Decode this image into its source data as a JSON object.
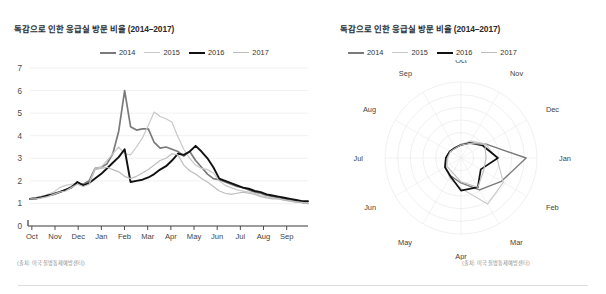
{
  "colors": {
    "series_2014": "#7a7a7a",
    "series_2015": "#c8c8c8",
    "series_2016": "#111111",
    "series_2017": "#bdbdbd",
    "grid": "#e9e9e9",
    "axis": "#3a3a3a",
    "text": "#3c3c3c",
    "note": "#8a8a8a",
    "divider": "#dddddd",
    "background": "#ffffff"
  },
  "left_panel": {
    "title": "독감으로 인한 응급실 방문 비율 (2014–2017)",
    "source_note": "(출처: 미국 질병통제예방센터)",
    "legend": [
      {
        "label": "2014",
        "color": "#7a7a7a",
        "width": 2.4
      },
      {
        "label": "2015",
        "color": "#c8c8c8",
        "width": 1.6
      },
      {
        "label": "2016",
        "color": "#111111",
        "width": 2.6
      },
      {
        "label": "2017",
        "color": "#bdbdbd",
        "width": 1.6
      }
    ]
  },
  "right_panel": {
    "title": "독감으로 인한 응급실 방문 비율 (2014–2017)",
    "source_note": "(출처: 미국 질병통제예방센터)",
    "legend": [
      {
        "label": "2014",
        "color": "#7a7a7a",
        "width": 2.4
      },
      {
        "label": "2015",
        "color": "#c8c8c8",
        "width": 1.6
      },
      {
        "label": "2016",
        "color": "#111111",
        "width": 2.6
      },
      {
        "label": "2017",
        "color": "#bdbdbd",
        "width": 1.6
      }
    ]
  },
  "chart_data": [
    {
      "type": "line",
      "title": "독감으로 인한 응급실 방문 비율 (2014–2017)",
      "xlabel": "",
      "ylabel": "",
      "ylim": [
        0,
        7
      ],
      "yticks": [
        0,
        1,
        2,
        3,
        4,
        5,
        6,
        7
      ],
      "grid": true,
      "legend_position": "top-center",
      "categories": [
        "Oct",
        "Nov",
        "Dec",
        "Jan",
        "Feb",
        "Mar",
        "Apr",
        "May",
        "Jun",
        "Jul",
        "Aug",
        "Sep"
      ],
      "x_tick_labels": [
        "Oct",
        "Nov",
        "Dec",
        "Jan",
        "Feb",
        "Mar",
        "Apr",
        "May",
        "Jun",
        "Jul",
        "Aug",
        "Sep"
      ],
      "n_points_per_series": 48,
      "series": [
        {
          "name": "2014",
          "color": "#7a7a7a",
          "values": [
            1.2,
            1.25,
            1.3,
            1.35,
            1.45,
            1.5,
            1.6,
            1.75,
            1.9,
            1.85,
            2.0,
            2.55,
            2.6,
            2.75,
            3.2,
            4.2,
            6.0,
            4.4,
            4.25,
            4.3,
            4.3,
            3.7,
            3.45,
            3.5,
            3.4,
            3.3,
            3.1,
            3.3,
            2.9,
            2.6,
            2.3,
            2.1,
            2.05,
            1.95,
            1.85,
            1.75,
            1.7,
            1.6,
            1.5,
            1.45,
            1.35,
            1.3,
            1.25,
            1.2,
            1.15,
            1.1,
            1.05,
            1.0
          ]
        },
        {
          "name": "2015",
          "color": "#c8c8c8",
          "values": [
            1.2,
            1.25,
            1.3,
            1.4,
            1.5,
            1.7,
            1.8,
            1.85,
            1.9,
            1.8,
            1.9,
            2.55,
            2.6,
            2.9,
            3.2,
            3.5,
            3.2,
            3.15,
            3.5,
            3.9,
            4.45,
            5.05,
            4.85,
            4.75,
            4.6,
            3.95,
            3.4,
            3.0,
            2.7,
            2.55,
            2.5,
            2.35,
            2.0,
            1.8,
            1.7,
            1.6,
            1.55,
            1.5,
            1.45,
            1.35,
            1.3,
            1.25,
            1.2,
            1.15,
            1.1,
            1.1,
            1.05,
            1.0
          ]
        },
        {
          "name": "2016",
          "color": "#111111",
          "values": [
            1.2,
            1.22,
            1.28,
            1.35,
            1.4,
            1.5,
            1.6,
            1.7,
            1.95,
            1.8,
            1.9,
            2.1,
            2.3,
            2.55,
            2.8,
            3.05,
            3.4,
            1.95,
            2.0,
            2.05,
            2.15,
            2.3,
            2.5,
            2.65,
            2.9,
            3.2,
            3.15,
            3.3,
            3.55,
            3.3,
            3.0,
            2.6,
            2.1,
            2.0,
            1.9,
            1.8,
            1.7,
            1.65,
            1.55,
            1.5,
            1.4,
            1.35,
            1.3,
            1.25,
            1.2,
            1.15,
            1.1,
            1.1
          ]
        },
        {
          "name": "2017",
          "color": "#bdbdbd",
          "values": [
            1.2,
            1.2,
            1.25,
            1.3,
            1.4,
            1.5,
            1.55,
            1.7,
            1.85,
            1.75,
            1.85,
            2.5,
            2.55,
            2.6,
            2.5,
            2.4,
            2.2,
            2.1,
            2.2,
            2.35,
            2.5,
            2.7,
            2.9,
            3.0,
            3.2,
            3.15,
            2.7,
            2.45,
            2.3,
            2.1,
            1.95,
            1.75,
            1.55,
            1.45,
            1.4,
            1.45,
            1.5,
            1.45,
            1.4,
            1.3,
            1.25,
            1.2,
            1.2,
            1.15,
            1.1,
            1.05,
            1.05,
            1.0
          ]
        }
      ]
    },
    {
      "type": "radar",
      "title": "독감으로 인한 응급실 방문 비율 (2014–2017)",
      "grid": true,
      "rings": 6,
      "rmax": 7,
      "legend_position": "top-center",
      "categories": [
        "Oct",
        "Nov",
        "Dec",
        "Jan",
        "Feb",
        "Mar",
        "Apr",
        "May",
        "Jun",
        "Jul",
        "Aug",
        "Sep"
      ],
      "series": [
        {
          "name": "2014",
          "color": "#7a7a7a",
          "values": [
            1.25,
            1.6,
            2.6,
            6.0,
            4.3,
            3.4,
            2.3,
            1.9,
            1.7,
            1.4,
            1.2,
            1.05
          ]
        },
        {
          "name": "2015",
          "color": "#c8c8c8",
          "values": [
            1.25,
            1.8,
            2.6,
            3.3,
            4.5,
            4.9,
            2.8,
            2.1,
            1.6,
            1.35,
            1.2,
            1.05
          ]
        },
        {
          "name": "2016",
          "color": "#111111",
          "values": [
            1.2,
            1.6,
            2.3,
            3.4,
            2.1,
            3.1,
            3.0,
            1.95,
            1.7,
            1.4,
            1.2,
            1.1
          ]
        },
        {
          "name": "2017",
          "color": "#bdbdbd",
          "values": [
            1.2,
            1.55,
            2.55,
            2.3,
            2.4,
            3.1,
            2.2,
            1.55,
            1.5,
            1.25,
            1.15,
            1.05
          ]
        }
      ]
    }
  ]
}
